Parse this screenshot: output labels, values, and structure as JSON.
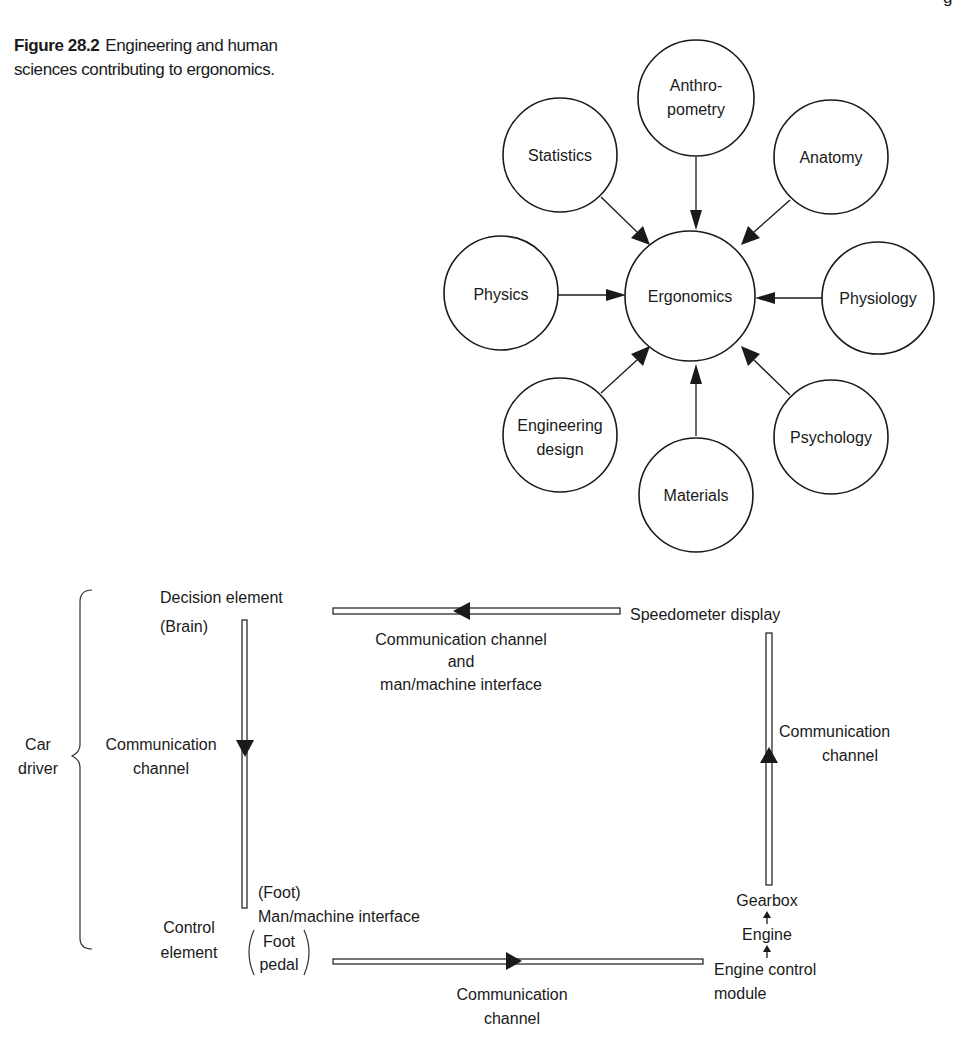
{
  "caption": {
    "figure_number": "Figure 28.2",
    "text": "Engineering and human sciences contributing to ergonomics."
  },
  "page_fragment": "g",
  "ergonomics_diagram": {
    "center": {
      "label": "Ergonomics"
    },
    "nodes": [
      {
        "id": "anthropometry",
        "lines": [
          "Anthro-",
          "pometry"
        ]
      },
      {
        "id": "statistics",
        "lines": [
          "Statistics"
        ]
      },
      {
        "id": "anatomy",
        "lines": [
          "Anatomy"
        ]
      },
      {
        "id": "physics",
        "lines": [
          "Physics"
        ]
      },
      {
        "id": "physiology",
        "lines": [
          "Physiology"
        ]
      },
      {
        "id": "engineering-design",
        "lines": [
          "Engineering",
          "design"
        ]
      },
      {
        "id": "materials",
        "lines": [
          "Materials"
        ]
      },
      {
        "id": "psychology",
        "lines": [
          "Psychology"
        ]
      }
    ]
  },
  "control_loop_diagram": {
    "car_driver": {
      "lines": [
        "Car",
        "driver"
      ]
    },
    "decision_element": {
      "lines": [
        "Decision element",
        "(Brain)"
      ]
    },
    "left_channel": {
      "lines": [
        "Communication",
        "channel"
      ]
    },
    "top_channel": {
      "lines": [
        "Communication channel",
        "and",
        "man/machine interface"
      ]
    },
    "speedometer": {
      "label": "Speedometer display"
    },
    "right_channel": {
      "lines": [
        "Communication",
        "channel"
      ]
    },
    "gearbox": {
      "label": "Gearbox"
    },
    "engine": {
      "label": "Engine"
    },
    "engine_control_module": {
      "lines": [
        "Engine control",
        "module"
      ]
    },
    "bottom_channel": {
      "lines": [
        "Communication",
        "channel"
      ]
    },
    "foot_interface": {
      "lines": [
        "(Foot)",
        "Man/machine interface"
      ]
    },
    "control_element": {
      "lines": [
        "Control",
        "element"
      ]
    },
    "foot_pedal": {
      "lines": [
        "Foot",
        "pedal"
      ]
    }
  }
}
